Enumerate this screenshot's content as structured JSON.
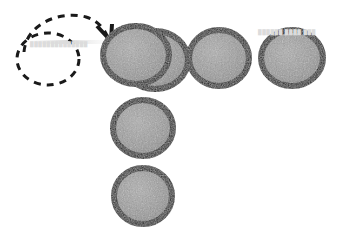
{
  "canvas": {
    "width": 340,
    "height": 233,
    "background": "#ffffff"
  },
  "style": {
    "disc_fill": "#9a9a9a",
    "disc_fill_light": "#b0b0b0",
    "disc_fill_dark": "#868686",
    "disc_outline": "#111111",
    "disc_outline_width": 6,
    "dashed_outline": "#1a1a1a",
    "dashed_outline_width": 3,
    "dash_pattern": "7 6",
    "arrow_color": "#1a1a1a",
    "watermark_color": "#dcdcdc"
  },
  "diagram": {
    "type": "disc-arrangement",
    "disc_radius_x": 33,
    "disc_radius_y": 29,
    "discs": [
      {
        "id": "disc-back-1",
        "label": "back disc of left pair",
        "cx": 155,
        "cy": 60,
        "rx": 33,
        "ry": 29,
        "layer": 1,
        "filled": true
      },
      {
        "id": "disc-front-1",
        "label": "front disc of left pair",
        "cx": 136,
        "cy": 55,
        "rx": 33,
        "ry": 29,
        "layer": 2,
        "filled": true
      },
      {
        "id": "disc-2",
        "label": "top row middle disc",
        "cx": 219,
        "cy": 58,
        "rx": 30,
        "ry": 28,
        "layer": 1,
        "filled": true
      },
      {
        "id": "disc-3",
        "label": "top row right disc",
        "cx": 292,
        "cy": 58,
        "rx": 31,
        "ry": 28,
        "layer": 1,
        "filled": true
      },
      {
        "id": "disc-4",
        "label": "column middle disc",
        "cx": 143,
        "cy": 128,
        "rx": 30,
        "ry": 28,
        "layer": 1,
        "filled": true
      },
      {
        "id": "disc-5",
        "label": "column bottom disc",
        "cx": 143,
        "cy": 196,
        "rx": 29,
        "ry": 28,
        "layer": 1,
        "filled": true
      }
    ],
    "empty_slot": {
      "id": "empty-slot",
      "label": "empty dashed circle slot",
      "cx": 48,
      "cy": 59,
      "rx": 31,
      "ry": 26
    },
    "arrow": {
      "id": "move-arrow",
      "label": "dashed curved arrow from empty slot to left disc pair",
      "path": "M 24 52 C 26 23, 62 10, 86 17 C 99 21, 105 30, 108 38",
      "head": "M 98 27 L 110 40 L 111 26",
      "style": "dashed",
      "direction": "clockwise"
    },
    "watermarks": [
      {
        "id": "watermark-right",
        "text": "██████ ████ ███",
        "x": 258,
        "y": 29
      },
      {
        "id": "watermark-left",
        "text": "██████████████",
        "x": 30,
        "y": 41
      }
    ]
  }
}
